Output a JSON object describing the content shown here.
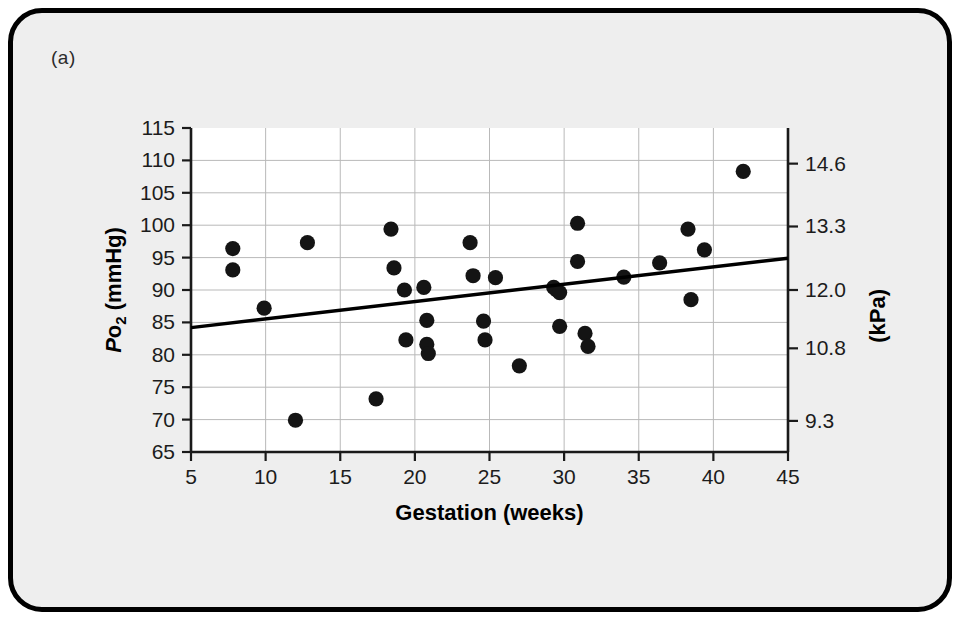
{
  "figure": {
    "panel_label": "(a)",
    "background_color": "#eeeeee",
    "border_color": "#000000"
  },
  "chart_data": {
    "type": "scatter",
    "title": "",
    "xlabel": "Gestation (weeks)",
    "ylabel": "Po2 (mmHg)",
    "ylabel_secondary": "(kPa)",
    "xlim": [
      5,
      45
    ],
    "ylim": [
      65,
      115
    ],
    "grid": true,
    "legend": "none",
    "xticks": [
      5,
      10,
      15,
      20,
      25,
      30,
      35,
      40,
      45
    ],
    "xtick_labels": [
      "5",
      "10",
      "15",
      "20",
      "25",
      "30",
      "35",
      "40",
      "45"
    ],
    "yticks": [
      65,
      70,
      75,
      80,
      85,
      90,
      95,
      100,
      105,
      110,
      115
    ],
    "ytick_labels": [
      "65",
      "70",
      "75",
      "80",
      "85",
      "90",
      "95",
      "100",
      "105",
      "110",
      "115"
    ],
    "y2_ticks_mmHg": [
      69.8,
      81.0,
      90.0,
      99.8,
      109.5
    ],
    "y2_tick_labels": [
      "9.3",
      "10.8",
      "12.0",
      "13.3",
      "14.6"
    ],
    "points": [
      {
        "x": 7.8,
        "y": 96.4
      },
      {
        "x": 7.8,
        "y": 93.1
      },
      {
        "x": 9.9,
        "y": 87.2
      },
      {
        "x": 12.0,
        "y": 69.9
      },
      {
        "x": 12.8,
        "y": 97.3
      },
      {
        "x": 17.4,
        "y": 73.2
      },
      {
        "x": 18.4,
        "y": 99.4
      },
      {
        "x": 18.6,
        "y": 93.4
      },
      {
        "x": 19.3,
        "y": 90.0
      },
      {
        "x": 19.4,
        "y": 82.3
      },
      {
        "x": 20.6,
        "y": 90.4
      },
      {
        "x": 20.8,
        "y": 85.3
      },
      {
        "x": 20.8,
        "y": 81.6
      },
      {
        "x": 20.9,
        "y": 80.2
      },
      {
        "x": 23.7,
        "y": 97.3
      },
      {
        "x": 23.9,
        "y": 92.2
      },
      {
        "x": 24.6,
        "y": 85.2
      },
      {
        "x": 24.7,
        "y": 82.3
      },
      {
        "x": 25.4,
        "y": 91.9
      },
      {
        "x": 27.0,
        "y": 78.3
      },
      {
        "x": 29.3,
        "y": 90.4
      },
      {
        "x": 29.5,
        "y": 90.0
      },
      {
        "x": 29.7,
        "y": 89.6
      },
      {
        "x": 29.7,
        "y": 84.4
      },
      {
        "x": 30.9,
        "y": 100.3
      },
      {
        "x": 30.9,
        "y": 94.4
      },
      {
        "x": 31.4,
        "y": 83.3
      },
      {
        "x": 31.6,
        "y": 81.3
      },
      {
        "x": 34.0,
        "y": 92.0
      },
      {
        "x": 36.4,
        "y": 94.2
      },
      {
        "x": 38.3,
        "y": 99.4
      },
      {
        "x": 38.5,
        "y": 88.5
      },
      {
        "x": 39.4,
        "y": 96.2
      },
      {
        "x": 42.0,
        "y": 108.3
      }
    ],
    "fit_line": {
      "label": "regression line",
      "x0": 5,
      "y0": 84.2,
      "x1": 45,
      "y1": 94.9
    }
  }
}
